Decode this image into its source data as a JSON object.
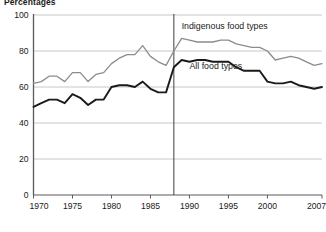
{
  "chart_data": {
    "type": "line",
    "title": "Percentages",
    "xlabel": "",
    "ylabel": "",
    "xlim": [
      1970,
      2007
    ],
    "ylim": [
      0,
      100
    ],
    "yticks": [
      0,
      20,
      40,
      60,
      80,
      100
    ],
    "xticks": [
      1970,
      1975,
      1980,
      1985,
      1990,
      1995,
      2000,
      2007
    ],
    "grid": "horizontal",
    "legend_position": "inline-annotations",
    "annotations": [
      {
        "text": "Indigenous food types",
        "x": 1989,
        "y": 92
      },
      {
        "text": "All food types",
        "x": 1990,
        "y": 70
      }
    ],
    "reference_lines": [
      {
        "x": 1988,
        "orientation": "vertical",
        "color": "#3f3f3f"
      }
    ],
    "x": [
      1970,
      1971,
      1972,
      1973,
      1974,
      1975,
      1976,
      1977,
      1978,
      1979,
      1980,
      1981,
      1982,
      1983,
      1984,
      1985,
      1986,
      1987,
      1988,
      1989,
      1990,
      1991,
      1992,
      1993,
      1994,
      1995,
      1996,
      1997,
      1998,
      1999,
      2000,
      2001,
      2002,
      2003,
      2004,
      2005,
      2006,
      2007
    ],
    "series": [
      {
        "name": "Indigenous food types",
        "color": "#8c8c8c",
        "values": [
          62,
          63,
          66,
          66,
          63,
          68,
          68,
          63,
          67,
          68,
          73,
          76,
          78,
          78,
          83,
          77,
          74,
          72,
          80,
          87,
          86,
          85,
          85,
          85,
          86,
          86,
          84,
          83,
          82,
          82,
          80,
          75,
          76,
          77,
          76,
          74,
          72,
          73
        ]
      },
      {
        "name": "All food types",
        "color": "#1a1a1a",
        "values": [
          49,
          51,
          53,
          53,
          51,
          56,
          54,
          50,
          53,
          53,
          60,
          61,
          61,
          60,
          63,
          59,
          57,
          57,
          71,
          75,
          74,
          75,
          75,
          74,
          74,
          74,
          71,
          69,
          69,
          69,
          63,
          62,
          62,
          63,
          61,
          60,
          59,
          60
        ]
      }
    ]
  },
  "axes": {
    "ytick_labels": [
      "0",
      "20",
      "40",
      "60",
      "80",
      "100"
    ],
    "xtick_labels": [
      "1970",
      "1975",
      "1980",
      "1985",
      "1990",
      "1995",
      "2000",
      "2007"
    ]
  },
  "colors": {
    "indigenous_line": "#8c8c8c",
    "all_line": "#1a1a1a",
    "gridline": "#c8c8c8",
    "axis": "#5a5a5a",
    "reference_line": "#3f3f3f",
    "background": "#ffffff"
  }
}
